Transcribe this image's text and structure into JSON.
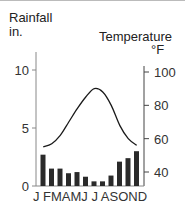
{
  "chart_data": {
    "type": "bar+line",
    "title": "",
    "ylabel_left": "Rainfall in.",
    "ylabel_right": "Temperature °F",
    "categories": [
      "J",
      "F",
      "M",
      "A",
      "M",
      "J",
      "J",
      "A",
      "S",
      "O",
      "N",
      "D"
    ],
    "series": [
      {
        "name": "Rainfall (in.)",
        "type": "bar",
        "axis": "left",
        "values": [
          2.7,
          1.5,
          1.5,
          1.1,
          1.2,
          0.8,
          0.4,
          0.4,
          0.9,
          2.1,
          2.4,
          3.0
        ]
      },
      {
        "name": "Temperature (°F)",
        "type": "line",
        "axis": "right",
        "values": [
          55,
          57,
          62,
          70,
          78,
          85,
          90,
          88,
          80,
          68,
          60,
          56
        ]
      }
    ],
    "ylim_left": [
      0,
      10
    ],
    "yticks_left": [
      0,
      5,
      10
    ],
    "ylim_right": [
      31,
      100
    ],
    "yticks_right": [
      40,
      60,
      80,
      100
    ],
    "grid": false,
    "legend": "none"
  },
  "labels": {
    "rain_title": "Rainfall",
    "rain_unit": "in.",
    "temp_title": "Temperature",
    "temp_unit": "°F",
    "months": "J FMAMJ J ASOND"
  }
}
